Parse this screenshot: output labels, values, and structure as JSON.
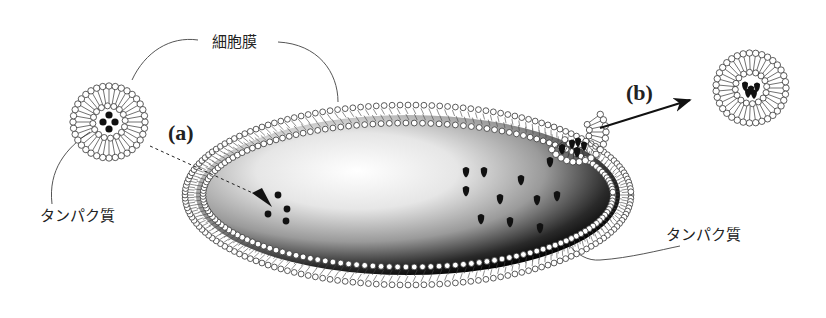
{
  "diagram": {
    "labels": {
      "membrane": "細胞膜",
      "protein_left": "タンパク質",
      "protein_right": "タンパク質",
      "step_a": "(a)",
      "step_b": "(b)"
    },
    "colors": {
      "stroke": "#333333",
      "lipid_head_fill": "#ffffff",
      "protein_fill": "#111111",
      "cell_dark": "#0a0a0a",
      "cell_light": "#ffffff",
      "leader_line": "#555555"
    },
    "cell": {
      "cx": 408,
      "cy": 195,
      "rx": 215,
      "ry": 82
    },
    "micelle_left": {
      "cx": 109,
      "cy": 122,
      "r": 36,
      "cargo": "spheres"
    },
    "micelle_right": {
      "cx": 751,
      "cy": 88,
      "r": 35,
      "cargo": "proteins"
    },
    "budding_micelle": {
      "cx": 576,
      "cy": 132,
      "r": 30
    },
    "internal_spheres": [
      [
        278,
        195
      ],
      [
        287,
        209
      ],
      [
        268,
        214
      ],
      [
        286,
        221
      ]
    ],
    "internal_proteins": [
      [
        466,
        172
      ],
      [
        484,
        172
      ],
      [
        521,
        180
      ],
      [
        466,
        191
      ],
      [
        500,
        199
      ],
      [
        537,
        200
      ],
      [
        557,
        196
      ],
      [
        481,
        219
      ],
      [
        510,
        222
      ],
      [
        540,
        228
      ],
      [
        550,
        162
      ],
      [
        562,
        149
      ],
      [
        577,
        152
      ]
    ]
  }
}
